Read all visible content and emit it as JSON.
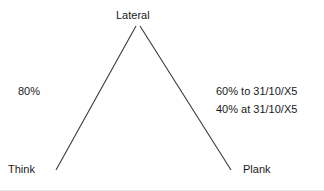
{
  "diagram": {
    "type": "tree-peak",
    "background_color": "#ffffff",
    "line_color": "#3a3a3a",
    "text_color": "#1a1a1a",
    "nodes": [
      {
        "id": "lateral",
        "label": "Lateral",
        "position": "apex"
      },
      {
        "id": "think",
        "label": "Think",
        "position": "bottom-left"
      },
      {
        "id": "plank",
        "label": "Plank",
        "position": "bottom-right"
      }
    ],
    "edges": [
      {
        "id": "lateral-think",
        "from": "Lateral",
        "to": "Think",
        "x1": 136,
        "y1": 26,
        "x2": 56,
        "y2": 170
      },
      {
        "id": "lateral-plank",
        "from": "Lateral",
        "to": "Plank",
        "x1": 140,
        "y1": 26,
        "x2": 231,
        "y2": 170
      }
    ],
    "annotations": {
      "left_branch": "80%",
      "right_branch_line1": "60% to 31/10/X5",
      "right_branch_line2": "40% at 31/10/X5"
    }
  }
}
